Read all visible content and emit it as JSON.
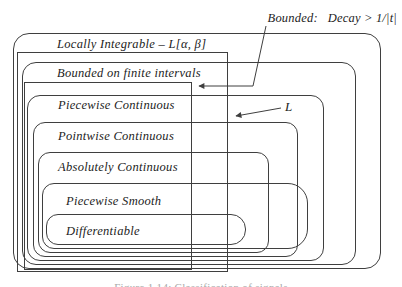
{
  "diagram": {
    "classes": [
      {
        "label": "Locally Integrable – L[α, β]"
      },
      {
        "label": "Bounded on finite intervals"
      },
      {
        "label": "Piecewise Continuous"
      },
      {
        "label": "Pointwise Continuous"
      },
      {
        "label": "Absolutely Continuous"
      },
      {
        "label": "Piecewise Smooth"
      },
      {
        "label": "Differentiable"
      }
    ],
    "annotations": {
      "bounded_decay": "Bounded:   Decay > 1/|t|",
      "l_space": "L"
    },
    "caption": "Figure 1.14: Classification of signals",
    "colors": {
      "line": "#3f3f3f",
      "text": "#1c1c1c",
      "background": "#ffffff",
      "caption": "#a8a8a8"
    }
  }
}
